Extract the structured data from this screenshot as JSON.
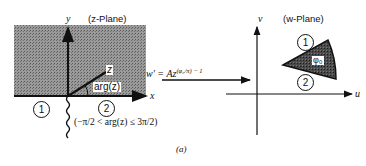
{
  "z_plane": {
    "title": "(z-Plane)",
    "x_axis_label": "x",
    "y_axis_label": "y",
    "point_label": "z",
    "angle_label": "arg(z)",
    "region_1": "1",
    "region_2": "2",
    "branch_condition": "(−π/2 < arg(z) ≤ 3π/2)",
    "shading_color": "#8a8a8a"
  },
  "mapping": {
    "formula_lhs": "w′ = Az",
    "formula_exponent": "(φ₀/π) − 1"
  },
  "w_plane": {
    "title": "(w-Plane)",
    "u_axis_label": "u",
    "v_axis_label": "v",
    "wedge_label": "φ₀",
    "region_1": "1",
    "region_2": "2",
    "wedge_color": "#3a3a3a"
  },
  "caption": "(a)"
}
